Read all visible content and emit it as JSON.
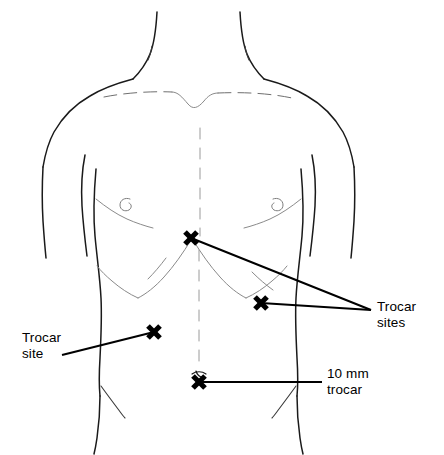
{
  "figure": {
    "background_color": "#ffffff",
    "line_color": "#1a1a1a",
    "width": 444,
    "height": 455
  },
  "labels": {
    "trocar_sites": "Trocar\nsites",
    "trocar_site": "Trocar\nsite",
    "ten_mm_trocar": "10 mm\ntrocar"
  },
  "markers": [
    {
      "name": "xiphoid-trocar-site",
      "x": 191,
      "y": 238,
      "label": "Trocar sites"
    },
    {
      "name": "right-subcostal-trocar-site",
      "x": 261,
      "y": 303,
      "label": "Trocar sites"
    },
    {
      "name": "left-flank-trocar-site",
      "x": 154,
      "y": 332,
      "label": "Trocar site"
    },
    {
      "name": "umbilical-trocar-site",
      "x": 199,
      "y": 382,
      "label": "10 mm trocar"
    }
  ],
  "leaders": [
    {
      "name": "leader-xiphoid-to-trocar-sites",
      "from_x": 191,
      "from_y": 238,
      "to_x": 371,
      "to_y": 310
    },
    {
      "name": "leader-subcostal-to-trocar-sites",
      "from_x": 261,
      "from_y": 303,
      "to_x": 371,
      "to_y": 310
    },
    {
      "name": "leader-flank-to-trocar-site",
      "from_x": 154,
      "from_y": 332,
      "to_x": 62,
      "to_y": 355
    },
    {
      "name": "leader-umbilicus-to-ten-mm",
      "from_x": 199,
      "from_y": 382,
      "to_x": 322,
      "to_y": 382
    }
  ],
  "anatomy": {
    "nipple_left": {
      "x": 126,
      "y": 204
    },
    "nipple_right": {
      "x": 277,
      "y": 204
    },
    "umbilicus": {
      "x": 199,
      "y": 375
    },
    "sternal_notch": {
      "x": 200,
      "y": 98
    }
  }
}
